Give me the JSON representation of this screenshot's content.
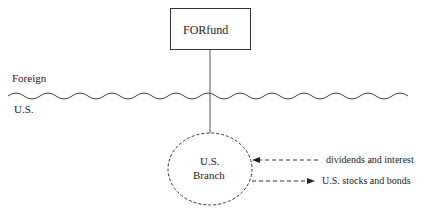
{
  "diagram": {
    "fund_box": {
      "label": "FORfund"
    },
    "regions": {
      "top": "Foreign",
      "bottom": "U.S."
    },
    "branch": {
      "line1": "U.S.",
      "line2": "Branch"
    },
    "flows": [
      {
        "label": "dividends and interest",
        "direction": "into-branch"
      },
      {
        "label": "U.S. stocks and bonds",
        "direction": "out-of-branch"
      }
    ]
  }
}
